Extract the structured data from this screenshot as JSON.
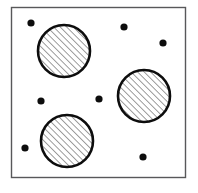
{
  "figure": {
    "title": "Schematic of circular inclusions in a rectangular matrix",
    "canvas": {
      "width": 198,
      "height": 193,
      "background": "#ffffff"
    },
    "frame": {
      "label": "matrix-boundary",
      "x": 11.5,
      "y": 7.5,
      "width": 174,
      "height": 170,
      "stroke": "#58585a",
      "stroke_width": 1.4,
      "fill": "#ffffff"
    },
    "hatch": {
      "label": "diagonal-hatch-45deg",
      "angle_degrees": 45,
      "direction": "lower-left to upper-right",
      "spacing": 4.6,
      "stroke": "#1a1a1a",
      "stroke_width": 0.85
    },
    "circles": [
      {
        "id": "circle-top-left",
        "label": "Hatched circle (upper left)",
        "cx": 64,
        "cy": 51,
        "r": 26,
        "stroke": "#0d0d0d",
        "stroke_width": 2.6,
        "fill": "hatched"
      },
      {
        "id": "circle-right",
        "label": "Hatched circle (right)",
        "cx": 144,
        "cy": 96,
        "r": 26,
        "stroke": "#0d0d0d",
        "stroke_width": 2.6,
        "fill": "hatched"
      },
      {
        "id": "circle-bottom-left",
        "label": "Hatched circle (lower left)",
        "cx": 67,
        "cy": 141,
        "r": 26,
        "stroke": "#0d0d0d",
        "stroke_width": 2.6,
        "fill": "hatched"
      }
    ],
    "dots": [
      {
        "id": "dot-1",
        "label": "Solid dot (upper left)",
        "cx": 31,
        "cy": 23,
        "r": 3.6,
        "fill": "#0d0d0d"
      },
      {
        "id": "dot-2",
        "label": "Solid dot (upper center)",
        "cx": 124,
        "cy": 27,
        "r": 3.6,
        "fill": "#0d0d0d"
      },
      {
        "id": "dot-3",
        "label": "Solid dot (upper right)",
        "cx": 163,
        "cy": 43,
        "r": 3.6,
        "fill": "#0d0d0d"
      },
      {
        "id": "dot-4",
        "label": "Solid dot (middle left)",
        "cx": 41,
        "cy": 101,
        "r": 3.6,
        "fill": "#0d0d0d"
      },
      {
        "id": "dot-5",
        "label": "Solid dot (center)",
        "cx": 99,
        "cy": 99,
        "r": 3.6,
        "fill": "#0d0d0d"
      },
      {
        "id": "dot-6",
        "label": "Solid dot (lower left)",
        "cx": 25,
        "cy": 148,
        "r": 3.6,
        "fill": "#0d0d0d"
      },
      {
        "id": "dot-7",
        "label": "Solid dot (lower right)",
        "cx": 143,
        "cy": 157,
        "r": 3.6,
        "fill": "#0d0d0d"
      }
    ]
  }
}
